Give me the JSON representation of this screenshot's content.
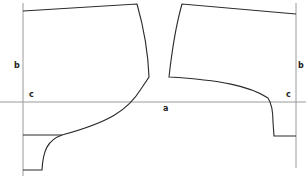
{
  "diagram": {
    "type": "sewing-pattern",
    "labels": {
      "left_b": "b",
      "right_b": "b",
      "left_c": "c",
      "right_c": "c",
      "center_a": "a"
    },
    "colors": {
      "pattern_line": "#2a2a2a",
      "guide_line": "#9a9a9a",
      "background": "#ffffff"
    }
  }
}
